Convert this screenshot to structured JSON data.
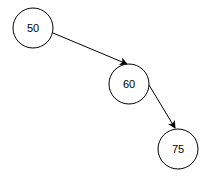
{
  "diagram": {
    "type": "binary-search-tree",
    "nodes": [
      {
        "id": "n50",
        "label": "50",
        "cx": 33,
        "cy": 28,
        "r": 20
      },
      {
        "id": "n60",
        "label": "60",
        "cx": 129,
        "cy": 84,
        "r": 20
      },
      {
        "id": "n75",
        "label": "75",
        "cx": 178,
        "cy": 149,
        "r": 20
      }
    ],
    "edges": [
      {
        "from": "50",
        "to": "60",
        "direction": "right-child"
      },
      {
        "from": "60",
        "to": "75",
        "direction": "right-child"
      }
    ]
  }
}
